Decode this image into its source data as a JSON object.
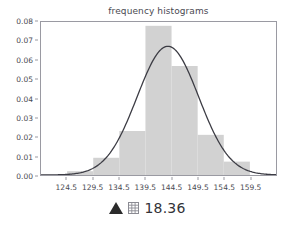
{
  "chart_data": {
    "type": "bar",
    "title": "frequency histograms",
    "xlabel": "",
    "ylabel": "",
    "xlim": [
      119.5,
      164.5
    ],
    "ylim": [
      0.0,
      0.08
    ],
    "grid": false,
    "legend": null,
    "xtick_labels": [
      "124.5",
      "129.5",
      "134.5",
      "139.5",
      "144.5",
      "149.5",
      "154.5",
      "159.5"
    ],
    "xtick_values": [
      124.5,
      129.5,
      134.5,
      139.5,
      144.5,
      149.5,
      154.5,
      159.5
    ],
    "ytick_labels": [
      "0.00",
      "0.01",
      "0.02",
      "0.03",
      "0.04",
      "0.05",
      "0.06",
      "0.07",
      "0.08"
    ],
    "ytick_values": [
      0.0,
      0.01,
      0.02,
      0.03,
      0.04,
      0.05,
      0.06,
      0.07,
      0.08
    ],
    "bar_edges": [
      119.5,
      124.5,
      129.5,
      134.5,
      139.5,
      144.5,
      149.5,
      154.5,
      159.5,
      164.5
    ],
    "categories": [
      "119.5-124.5",
      "124.5-129.5",
      "129.5-134.5",
      "134.5-139.5",
      "139.5-144.5",
      "144.5-149.5",
      "149.5-154.5",
      "154.5-159.5",
      "159.5-164.5"
    ],
    "values": [
      0.0,
      0.002,
      0.009,
      0.023,
      0.078,
      0.057,
      0.021,
      0.007,
      0.0
    ],
    "bar_color": "#d2d2d2",
    "series": [
      {
        "name": "normal density curve",
        "type": "line",
        "color": "#3c3c44",
        "mean": 143.8,
        "sigma": 5.9,
        "peak": 0.0673
      }
    ]
  },
  "caption": {
    "triangle_glyph": "triangle-up-icon",
    "grid_glyph": "grid-icon",
    "text": "18.36"
  },
  "colors": {
    "bar": "#d2d2d2",
    "curve": "#3c3c44",
    "axis": "#9a9aa2",
    "text": "#4a4a52",
    "background": "#ffffff"
  }
}
